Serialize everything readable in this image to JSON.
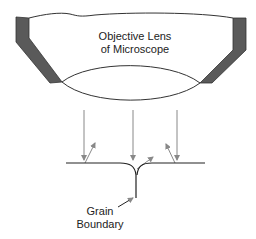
{
  "diagram": {
    "lens_label_line1": "Objective Lens",
    "lens_label_line2": "of Microscope",
    "boundary_label_line1": "Grain",
    "boundary_label_line2": "Boundary"
  },
  "colors": {
    "housing": "#555555",
    "line": "#222222",
    "arrow": "#888888"
  }
}
